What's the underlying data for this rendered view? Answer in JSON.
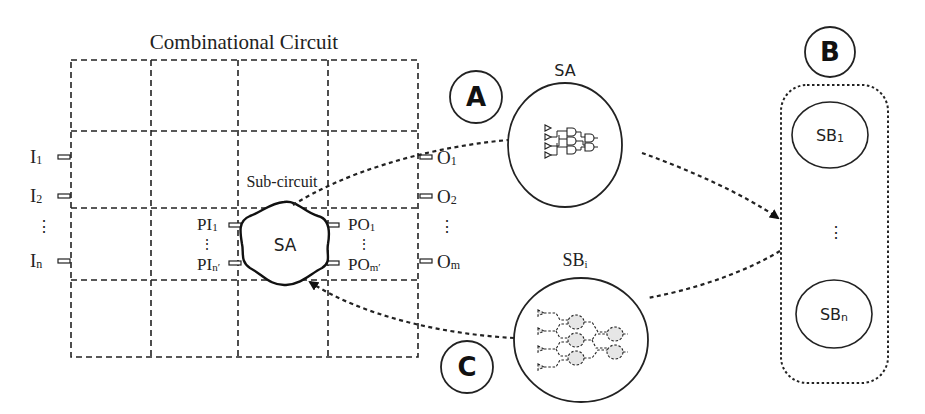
{
  "diagram": {
    "title": "Combinational Circuit",
    "colors": {
      "stroke": "#222222",
      "background": "#ffffff",
      "ghost_gate_fill": "#e6e6e6"
    },
    "grid": {
      "columns": 4,
      "rows": 4
    },
    "inputs": {
      "first": "I",
      "first_sub": "1",
      "second": "I",
      "second_sub": "2",
      "ellipsis": "⋮",
      "last": "I",
      "last_sub": "n"
    },
    "outputs": {
      "first": "O",
      "first_sub": "1",
      "second": "O",
      "second_sub": "2",
      "ellipsis": "⋮",
      "last": "O",
      "last_sub": "m"
    },
    "subcircuit": {
      "label": "Sub-circuit",
      "name": "SA",
      "pi_first": "PI",
      "pi_first_sub": "1",
      "pi_ellipsis": "⋮",
      "pi_last": "PI",
      "pi_last_sub": "n′",
      "po_first": "PO",
      "po_first_sub": "1",
      "po_ellipsis": "⋮",
      "po_last": "PO",
      "po_last_sub": "m′"
    },
    "steps": {
      "a": "A",
      "b": "B",
      "c": "C"
    },
    "sa_node": {
      "label": "SA",
      "icon": "logic-gate-network-icon"
    },
    "sbi_node": {
      "label": "SB",
      "label_sub": "i",
      "icon": "approximate-gate-network-icon"
    },
    "sb_set": {
      "first": "SB",
      "first_sub": "1",
      "ellipsis": "⋮",
      "last": "SB",
      "last_sub": "n"
    }
  }
}
